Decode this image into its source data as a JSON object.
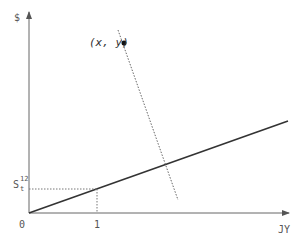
{
  "diagram": {
    "type": "geometric-projection",
    "axes": {
      "y_label": "$",
      "x_label": "JY",
      "origin_label": "0",
      "x_tick_label": "1"
    },
    "s_label": {
      "base": "S",
      "subscript": "t",
      "superscript": "12"
    },
    "point_label": "(x,  y)",
    "elements": [
      {
        "name": "line-through-origin",
        "style": "solid",
        "from": [
          0,
          0
        ],
        "to": [
          288,
          121
        ]
      },
      {
        "name": "perpendicular-projection",
        "style": "dotted",
        "from": [
          118,
          30
        ],
        "to": [
          178,
          200
        ]
      },
      {
        "name": "point",
        "at": [
          124,
          43
        ]
      }
    ]
  }
}
